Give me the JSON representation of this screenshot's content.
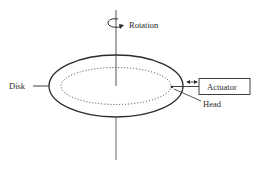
{
  "diagram": {
    "labels": {
      "rotation": "Rotation",
      "disk": "Disk",
      "actuator": "Actuator",
      "head": "Head"
    },
    "colors": {
      "stroke": "#2a2a2a",
      "axis": "#555555",
      "background": "#ffffff"
    }
  }
}
